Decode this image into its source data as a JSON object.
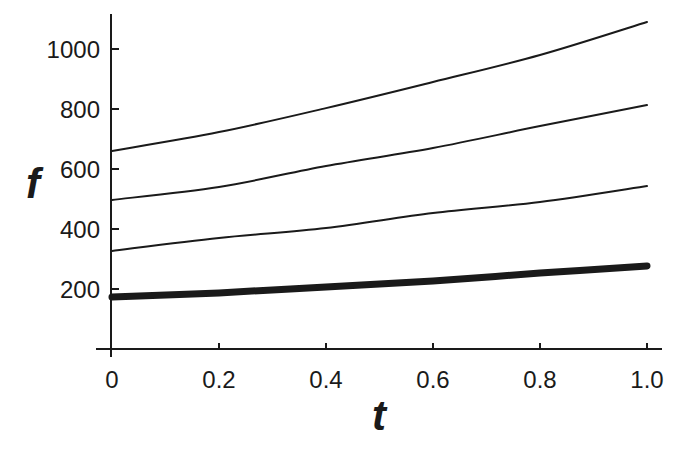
{
  "chart_data": {
    "type": "line",
    "title": "",
    "xlabel": "t",
    "ylabel": "f",
    "xlim": [
      0,
      1.0
    ],
    "ylim": [
      0,
      1130
    ],
    "grid": false,
    "legend": null,
    "x_ticks": [
      {
        "value": 0,
        "label": "0"
      },
      {
        "value": 0.2,
        "label": "0.2"
      },
      {
        "value": 0.4,
        "label": "0.4"
      },
      {
        "value": 0.6,
        "label": "0.6"
      },
      {
        "value": 0.8,
        "label": "0.8"
      },
      {
        "value": 1.0,
        "label": "1.0"
      }
    ],
    "y_ticks": [
      {
        "value": 200,
        "label": "200"
      },
      {
        "value": 400,
        "label": "400"
      },
      {
        "value": 600,
        "label": "600"
      },
      {
        "value": 800,
        "label": "800"
      },
      {
        "value": 1000,
        "label": "1000"
      }
    ],
    "x": [
      0,
      0.2,
      0.4,
      0.6,
      0.8,
      1.0
    ],
    "series": [
      {
        "name": "curve-1 (top)",
        "width": 2,
        "values": [
          660,
          723,
          803,
          890,
          980,
          1090
        ]
      },
      {
        "name": "curve-2",
        "width": 2,
        "values": [
          497,
          540,
          610,
          670,
          743,
          813
        ]
      },
      {
        "name": "curve-3",
        "width": 2,
        "values": [
          327,
          370,
          403,
          453,
          490,
          543
        ]
      },
      {
        "name": "curve-4 (thick, bottom)",
        "width": 7,
        "values": [
          173,
          187,
          207,
          227,
          253,
          277
        ]
      }
    ],
    "colors": {
      "ink": "#1a1a1a",
      "background": "#ffffff"
    }
  }
}
